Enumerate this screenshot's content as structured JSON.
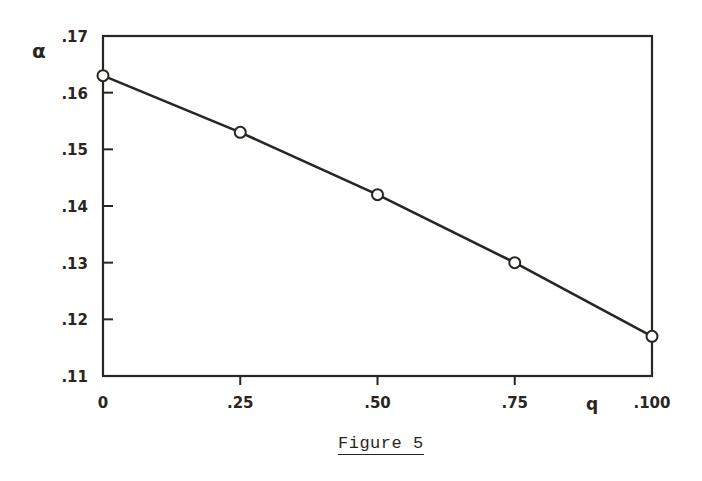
{
  "chart_data": {
    "type": "line",
    "title": "",
    "xlabel": "q",
    "ylabel": "α",
    "x": [
      0,
      0.25,
      0.5,
      0.75,
      1.0
    ],
    "series": [
      {
        "name": "α vs q",
        "values": [
          0.163,
          0.153,
          0.142,
          0.13,
          0.117
        ],
        "marker": "open-circle"
      }
    ],
    "xlim": [
      0,
      1.0
    ],
    "ylim": [
      0.11,
      0.17
    ],
    "x_tick_labels": [
      "0",
      ".25",
      ".50",
      ".75",
      ".100"
    ],
    "y_tick_labels": [
      ".11",
      ".12",
      ".13",
      ".14",
      ".15",
      ".16",
      ".17"
    ],
    "grid": false,
    "legend": null
  },
  "caption": "Figure 5",
  "colors": {
    "ink": "#2a2522",
    "background": "#ffffff"
  }
}
